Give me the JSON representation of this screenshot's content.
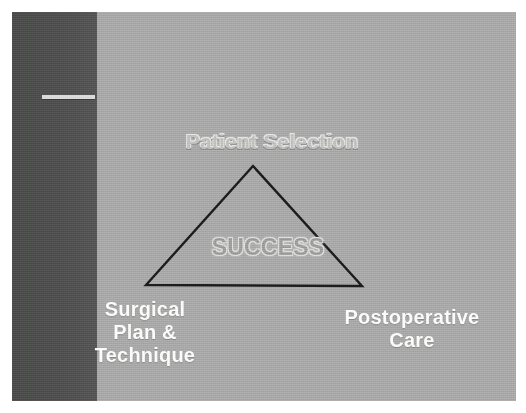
{
  "slide": {
    "kind": "presentation-slide-figure",
    "background_color": "#a7a8a7",
    "sidebar_band_color": "#4d4e4d",
    "accent_rule_color": "#d9dad8",
    "page_margin_color": "#ffffff"
  },
  "diagram": {
    "name": "success-triangle",
    "shape": "triangle",
    "outline_color": "#1c1c1c",
    "outline_width": 2,
    "vertices": {
      "apex": {
        "x": 241,
        "y": 154
      },
      "bottom_left": {
        "x": 134,
        "y": 273
      },
      "bottom_right": {
        "x": 350,
        "y": 274
      }
    },
    "center_label": "SUCCESS",
    "corner_labels": [
      {
        "position": "apex",
        "text": "Patient Selection",
        "color": "#bfc0be"
      },
      {
        "position": "bottom-left",
        "text": "Surgical\nPlan &\nTechnique",
        "color": "#fbfbfa"
      },
      {
        "position": "bottom-right",
        "text": "Postoperative\nCare",
        "color": "#fbfbfa"
      }
    ]
  },
  "labels": {
    "apex": "Patient Selection",
    "center": "SUCCESS",
    "bottom_left": "Surgical\nPlan &\nTechnique",
    "bottom_right": "Postoperative\nCare"
  }
}
